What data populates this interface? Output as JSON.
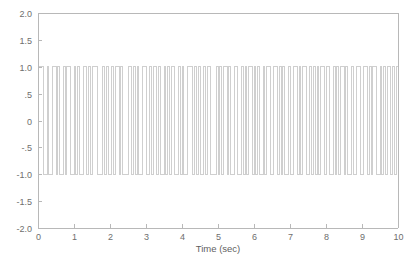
{
  "chart_data": {
    "type": "line",
    "title": "",
    "subtitle": "",
    "xlabel": "Time (sec)",
    "ylabel": "",
    "xlim": [
      0,
      10
    ],
    "ylim": [
      -2.0,
      2.0
    ],
    "grid": false,
    "legend": null,
    "line_color": "#cfcfcf",
    "axis_color": "#b8b8b8",
    "tick_label_color": "#6e6e6e",
    "background": "#ffffff",
    "xticks": [
      0,
      1,
      2,
      3,
      4,
      5,
      6,
      7,
      8,
      9,
      10
    ],
    "xtick_labels": [
      "0",
      "1",
      "2",
      "3",
      "4",
      "5",
      "6",
      "7",
      "8",
      "9",
      "10"
    ],
    "yticks": [
      2.0,
      1.5,
      1.0,
      0.5,
      0,
      -0.5,
      -1.0,
      -1.5,
      -2.0
    ],
    "ytick_labels": [
      "2.0",
      "1.5",
      "1.0",
      ".5",
      "0",
      "-.5",
      "-1.0",
      "-1.5",
      "-2.0"
    ],
    "series": [
      {
        "name": "binary NRZ waveform",
        "description": "Square wave alternating between +1 and -1, random bit pattern, bit period 0.05 sec",
        "waveform": "square",
        "high_value": 1,
        "low_value": -1,
        "bit_period": 0.05,
        "num_bits": 200,
        "bits": [
          1,
          1,
          1,
          -1,
          -1,
          1,
          -1,
          -1,
          1,
          1,
          -1,
          1,
          -1,
          -1,
          1,
          -1,
          1,
          1,
          -1,
          -1,
          1,
          -1,
          1,
          -1,
          -1,
          1,
          1,
          -1,
          1,
          -1,
          1,
          1,
          1,
          -1,
          -1,
          -1,
          1,
          -1,
          1,
          -1,
          -1,
          1,
          -1,
          1,
          1,
          -1,
          1,
          -1,
          -1,
          -1,
          1,
          1,
          -1,
          1,
          -1,
          1,
          -1,
          -1,
          1,
          1,
          -1,
          -1,
          1,
          -1,
          1,
          1,
          -1,
          1,
          -1,
          -1,
          1,
          -1,
          1,
          -1,
          1,
          1,
          -1,
          -1,
          1,
          -1,
          1,
          -1,
          -1,
          1,
          1,
          1,
          -1,
          1,
          -1,
          1,
          -1,
          -1,
          1,
          -1,
          1,
          1,
          -1,
          -1,
          -1,
          1,
          -1,
          1,
          -1,
          1,
          1,
          -1,
          1,
          -1,
          -1,
          1,
          1,
          -1,
          -1,
          1,
          -1,
          1,
          -1,
          1,
          1,
          -1,
          1,
          -1,
          1,
          -1,
          -1,
          1,
          -1,
          1,
          1,
          -1,
          -1,
          1,
          1,
          -1,
          1,
          -1,
          1,
          -1,
          -1,
          1,
          -1,
          -1,
          1,
          1,
          -1,
          1,
          -1,
          1,
          1,
          -1,
          -1,
          1,
          -1,
          1,
          -1,
          1,
          -1,
          1,
          1,
          -1,
          1,
          1,
          -1,
          -1,
          1,
          -1,
          1,
          -1,
          1,
          1,
          -1,
          1,
          -1,
          -1,
          1,
          -1,
          -1,
          1,
          1,
          -1,
          -1,
          1,
          1,
          -1,
          1,
          -1,
          1,
          1,
          -1,
          -1,
          1,
          -1,
          1,
          -1,
          1,
          1,
          -1,
          1,
          -1,
          1
        ]
      }
    ]
  },
  "geometry": {
    "plot_left": 38,
    "plot_right": 398,
    "plot_top": 13,
    "plot_bottom": 228
  }
}
